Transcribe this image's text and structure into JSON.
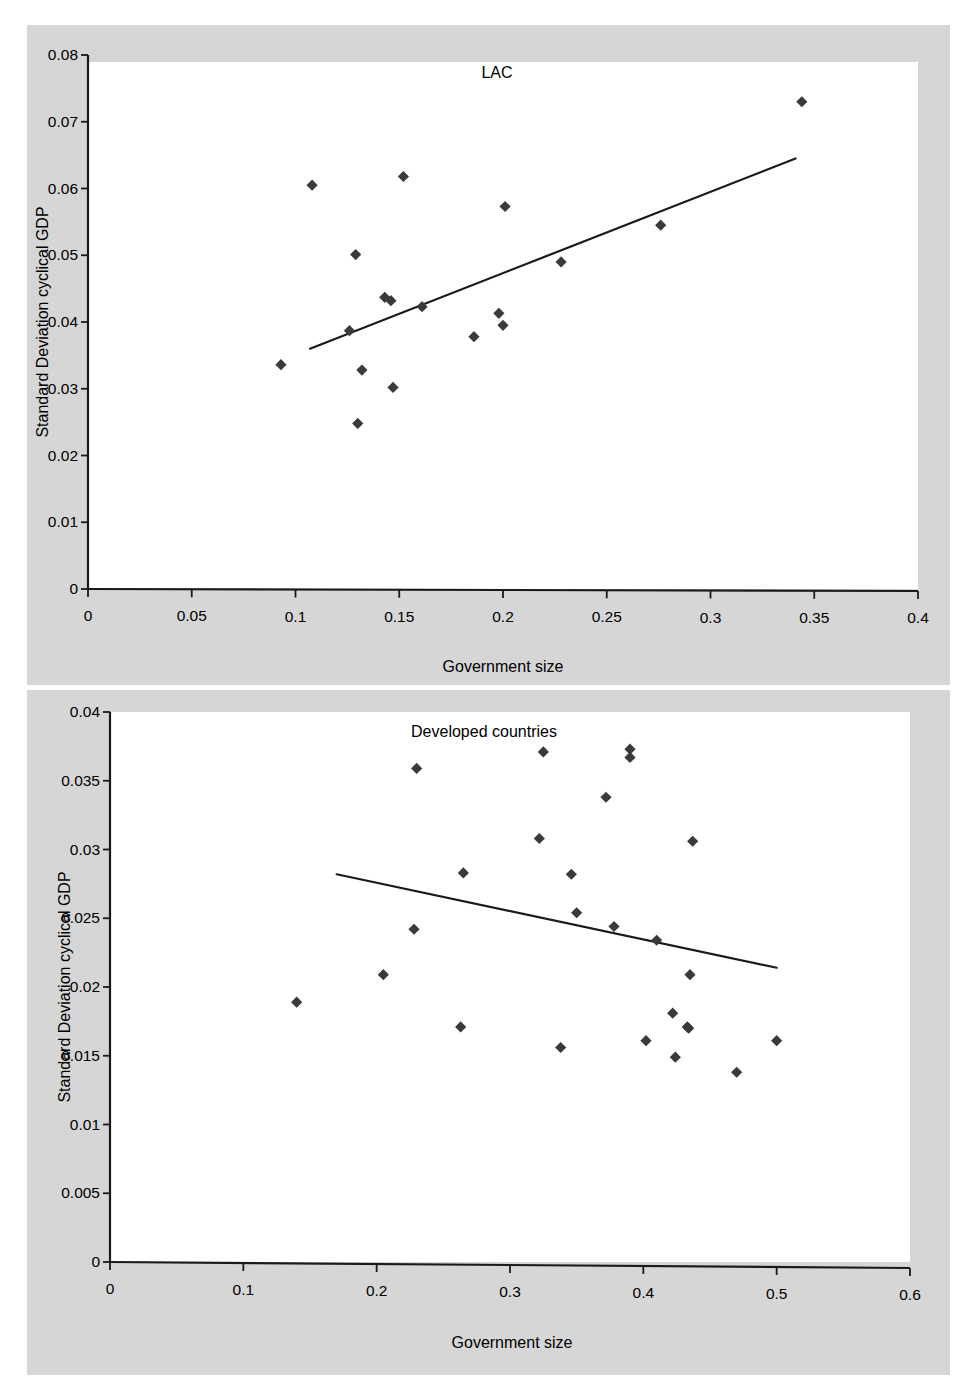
{
  "figure": {
    "background_color": "#d6d6d6",
    "plot_background_color": "#ffffff",
    "marker_color": "#3a3a3a",
    "line_color": "#1a1a1a"
  },
  "chart_data": [
    {
      "type": "scatter",
      "title": "LAC",
      "xlabel": "Government size",
      "ylabel": "Standard Deviation cyclical GDP",
      "xlim": [
        0,
        0.4
      ],
      "ylim": [
        0,
        0.08
      ],
      "xticks": [
        0,
        0.05,
        0.1,
        0.15,
        0.2,
        0.25,
        0.3,
        0.35,
        0.4
      ],
      "xtick_labels": [
        "0",
        "0.05",
        "0.1",
        "0.15",
        "0.2",
        "0.25",
        "0.3",
        "0.35",
        "0.4"
      ],
      "yticks": [
        0,
        0.01,
        0.02,
        0.03,
        0.04,
        0.05,
        0.06,
        0.07,
        0.08
      ],
      "ytick_labels": [
        "0",
        "0.01",
        "0.02",
        "0.03",
        "0.04",
        "0.05",
        "0.06",
        "0.07",
        "0.08"
      ],
      "grid": false,
      "legend": "none",
      "points": [
        {
          "x": 0.093,
          "y": 0.0336
        },
        {
          "x": 0.108,
          "y": 0.0605
        },
        {
          "x": 0.126,
          "y": 0.0387
        },
        {
          "x": 0.129,
          "y": 0.0501
        },
        {
          "x": 0.13,
          "y": 0.0248
        },
        {
          "x": 0.132,
          "y": 0.0328
        },
        {
          "x": 0.143,
          "y": 0.0437
        },
        {
          "x": 0.146,
          "y": 0.0432
        },
        {
          "x": 0.147,
          "y": 0.0302
        },
        {
          "x": 0.152,
          "y": 0.0618
        },
        {
          "x": 0.161,
          "y": 0.0423
        },
        {
          "x": 0.186,
          "y": 0.0378
        },
        {
          "x": 0.198,
          "y": 0.0413
        },
        {
          "x": 0.2,
          "y": 0.0395
        },
        {
          "x": 0.201,
          "y": 0.0573
        },
        {
          "x": 0.228,
          "y": 0.049
        },
        {
          "x": 0.276,
          "y": 0.0545
        },
        {
          "x": 0.344,
          "y": 0.073
        }
      ],
      "trendline": {
        "x0": 0.107,
        "y0": 0.036,
        "x1": 0.341,
        "y1": 0.0645
      }
    },
    {
      "type": "scatter",
      "title": "Developed countries",
      "xlabel": "Government size",
      "ylabel": "Standard Deviation cyclical GDP",
      "xlim": [
        0,
        0.6
      ],
      "ylim": [
        0,
        0.04
      ],
      "xticks": [
        0,
        0.1,
        0.2,
        0.3,
        0.4,
        0.5,
        0.6
      ],
      "xtick_labels": [
        "0",
        "0.1",
        "0.2",
        "0.3",
        "0.4",
        "0.5",
        "0.6"
      ],
      "yticks": [
        0,
        0.005,
        0.01,
        0.015,
        0.02,
        0.025,
        0.03,
        0.035,
        0.04
      ],
      "ytick_labels": [
        "0",
        "0.005",
        "0.01",
        "0.015",
        "0.02",
        "0.025",
        "0.03",
        "0.035",
        "0.04"
      ],
      "grid": false,
      "legend": "none",
      "points": [
        {
          "x": 0.14,
          "y": 0.0189
        },
        {
          "x": 0.205,
          "y": 0.0209
        },
        {
          "x": 0.228,
          "y": 0.0242
        },
        {
          "x": 0.23,
          "y": 0.0359
        },
        {
          "x": 0.263,
          "y": 0.0171
        },
        {
          "x": 0.265,
          "y": 0.0283
        },
        {
          "x": 0.322,
          "y": 0.0308
        },
        {
          "x": 0.325,
          "y": 0.0371
        },
        {
          "x": 0.338,
          "y": 0.0156
        },
        {
          "x": 0.346,
          "y": 0.0282
        },
        {
          "x": 0.35,
          "y": 0.0254
        },
        {
          "x": 0.372,
          "y": 0.0338
        },
        {
          "x": 0.378,
          "y": 0.0244
        },
        {
          "x": 0.39,
          "y": 0.0373
        },
        {
          "x": 0.39,
          "y": 0.0367
        },
        {
          "x": 0.402,
          "y": 0.0161
        },
        {
          "x": 0.41,
          "y": 0.0234
        },
        {
          "x": 0.422,
          "y": 0.0181
        },
        {
          "x": 0.424,
          "y": 0.0149
        },
        {
          "x": 0.433,
          "y": 0.0171
        },
        {
          "x": 0.434,
          "y": 0.017
        },
        {
          "x": 0.435,
          "y": 0.0209
        },
        {
          "x": 0.437,
          "y": 0.0306
        },
        {
          "x": 0.47,
          "y": 0.0138
        },
        {
          "x": 0.5,
          "y": 0.0161
        }
      ],
      "trendline": {
        "x0": 0.17,
        "y0": 0.0282,
        "x1": 0.5,
        "y1": 0.0214
      }
    }
  ]
}
